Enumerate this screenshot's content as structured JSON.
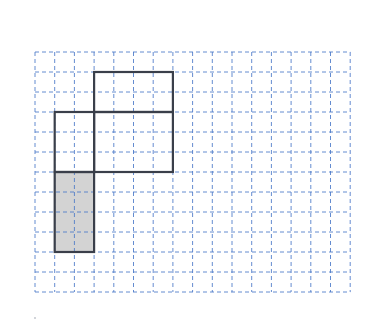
{
  "diagram": {
    "type": "grid-figure",
    "grid": {
      "origin_x": 35,
      "origin_y": 52,
      "cols": 16,
      "rows": 12,
      "cell_w": 19.7,
      "cell_h": 20,
      "line_color": "#4a78c8",
      "line_style": "dashed"
    },
    "outline_color": "#3a3f4a",
    "shaded_fill": "#d3d3d3",
    "shapes": [
      {
        "name": "top-rectangle",
        "col": 3,
        "row": 1,
        "w": 4,
        "h": 2,
        "shaded": false
      },
      {
        "name": "left-rectangle",
        "col": 1,
        "row": 3,
        "w": 2,
        "h": 3,
        "shaded": false
      },
      {
        "name": "right-rectangle",
        "col": 3,
        "row": 3,
        "w": 4,
        "h": 3,
        "shaded": false
      },
      {
        "name": "shaded-rectangle",
        "col": 1,
        "row": 6,
        "w": 2,
        "h": 4,
        "shaded": true
      }
    ]
  }
}
